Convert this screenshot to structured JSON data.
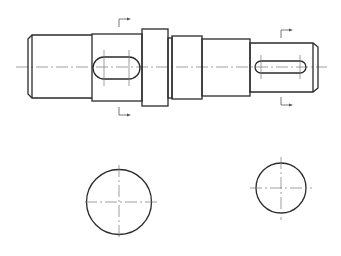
{
  "drawing": {
    "title": "Stepped shaft with keyways — front view and two cross sections",
    "colors": {
      "outline": "#2a2a2a",
      "centerline": "#777777",
      "background": "#ffffff"
    },
    "main_view": {
      "centerline": {
        "x1": 16,
        "x2": 327,
        "y": 67
      },
      "segments": [
        {
          "name": "left-journal",
          "x": 32,
          "y": 35,
          "w": 60,
          "h": 63,
          "chamfer_x": 28
        },
        {
          "name": "keyed-section-left",
          "x": 92,
          "y": 34,
          "w": 50,
          "h": 67
        },
        {
          "name": "collar",
          "x": 142,
          "y": 29,
          "w": 26,
          "h": 77
        },
        {
          "name": "relief-step",
          "x": 168,
          "y": 38,
          "w": 4,
          "h": 60
        },
        {
          "name": "middle-journal",
          "x": 172,
          "y": 36,
          "w": 30,
          "h": 63
        },
        {
          "name": "step-section",
          "x": 202,
          "y": 39,
          "w": 48,
          "h": 57
        },
        {
          "name": "keyed-section-right",
          "x": 250,
          "y": 43,
          "w": 63,
          "h": 49,
          "chamfer_x": 318
        }
      ],
      "keyways": [
        {
          "name": "keyway-left",
          "x": 93,
          "y": 57,
          "w": 47,
          "h": 22
        },
        {
          "name": "keyway-right",
          "x": 255,
          "y": 61,
          "w": 51,
          "h": 12
        }
      ],
      "section_markers": [
        {
          "name": "section-marker-left",
          "x": 119,
          "top_y": 19,
          "bottom_y": 115
        },
        {
          "name": "section-marker-right",
          "x": 281,
          "top_y": 30,
          "bottom_y": 105
        }
      ]
    },
    "sections": [
      {
        "name": "section-view-left",
        "cx": 119,
        "cy": 202,
        "r": 32.5
      },
      {
        "name": "section-view-right",
        "cx": 281,
        "cy": 188,
        "r": 25
      }
    ]
  }
}
